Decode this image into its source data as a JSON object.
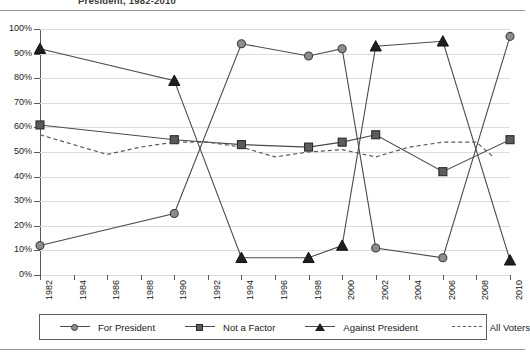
{
  "title": "President, 1982-2010",
  "chart_data": {
    "type": "line",
    "title": "President, 1982-2010",
    "xlabel": "",
    "ylabel": "",
    "xlim": [
      1982,
      2010
    ],
    "ylim": [
      0,
      100
    ],
    "grid": true,
    "legend_position": "bottom",
    "x_ticks": [
      "1982",
      "1984",
      "1986",
      "1988",
      "1990",
      "1992",
      "1994",
      "1996",
      "1998",
      "2000",
      "2002",
      "2004",
      "2006",
      "2008",
      "2010"
    ],
    "y_ticks": [
      "0%",
      "10%",
      "20%",
      "30%",
      "40%",
      "50%",
      "60%",
      "70%",
      "80%",
      "90%",
      "100%"
    ],
    "series": [
      {
        "name": "For President",
        "marker": "circle",
        "line": "solid",
        "color": "#8d8d8d",
        "x": [
          1982,
          1990,
          1994,
          1998,
          2000,
          2002,
          2006,
          2010
        ],
        "values": [
          12,
          25,
          94,
          89,
          92,
          11,
          7,
          97
        ]
      },
      {
        "name": "Not a Factor",
        "marker": "square",
        "line": "solid",
        "color": "#5c5c5c",
        "x": [
          1982,
          1990,
          1994,
          1998,
          2000,
          2002,
          2006,
          2010
        ],
        "values": [
          61,
          55,
          53,
          52,
          54,
          57,
          42,
          55
        ]
      },
      {
        "name": "Against President",
        "marker": "triangle",
        "line": "solid",
        "color": "#1f1f1f",
        "x": [
          1982,
          1990,
          1994,
          1998,
          2000,
          2002,
          2006,
          2010
        ],
        "values": [
          92,
          79,
          7,
          7,
          12,
          93,
          95,
          6
        ]
      },
      {
        "name": "All Voters",
        "marker": "none",
        "line": "dashed",
        "color": "#5a5a5a",
        "x": [
          1982,
          1984,
          1986,
          1988,
          1990,
          1992,
          1994,
          1996,
          1998,
          2000,
          2002,
          2004,
          2006,
          2008,
          2009
        ],
        "values": [
          57,
          53,
          49,
          52,
          54,
          54,
          52,
          48,
          50,
          51,
          48,
          52,
          54,
          54,
          48
        ]
      }
    ]
  },
  "legend": {
    "items": [
      {
        "label": "For President",
        "key": "circle-marker"
      },
      {
        "label": "Not a Factor",
        "key": "square-marker"
      },
      {
        "label": "Against President",
        "key": "triangle-marker"
      },
      {
        "label": "All Voters",
        "key": "dashed-line"
      }
    ]
  }
}
